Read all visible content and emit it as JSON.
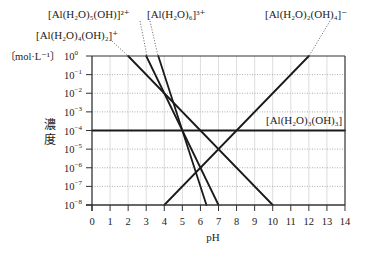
{
  "chart_data": {
    "type": "line",
    "title": "",
    "xlabel": "pH",
    "ylabel": "濃度",
    "yunit": "〔mol·L⁻¹〕",
    "xlim": [
      0,
      14
    ],
    "ylim_log10": [
      -8,
      0
    ],
    "x_ticks": [
      "0",
      "1",
      "2",
      "3",
      "4",
      "5",
      "6",
      "7",
      "8",
      "9",
      "10",
      "11",
      "12",
      "13",
      "14"
    ],
    "y_ticks": [
      {
        "exp": 0,
        "label": "10",
        "sup": "0"
      },
      {
        "exp": -1,
        "label": "10",
        "sup": "−1"
      },
      {
        "exp": -2,
        "label": "10",
        "sup": "−2"
      },
      {
        "exp": -3,
        "label": "10",
        "sup": "−3"
      },
      {
        "exp": -4,
        "label": "10",
        "sup": "−4"
      },
      {
        "exp": -5,
        "label": "10",
        "sup": "−5"
      },
      {
        "exp": -6,
        "label": "10",
        "sup": "−6"
      },
      {
        "exp": -7,
        "label": "10",
        "sup": "−7"
      },
      {
        "exp": -8,
        "label": "10",
        "sup": "−8"
      }
    ],
    "grid": true,
    "series": [
      {
        "name": "[Al(H2O)6]3+",
        "label": "[Al(H₂O)₆]³⁺",
        "points": [
          [
            3.667,
            0
          ],
          [
            6.333,
            -8
          ]
        ],
        "slope": -3
      },
      {
        "name": "[Al(H2O)5(OH)]2+",
        "label": "[Al(H₂O)₅(OH)]²⁺",
        "points": [
          [
            3,
            0
          ],
          [
            7,
            -8
          ]
        ],
        "slope": -2
      },
      {
        "name": "[Al(H2O)4(OH)2]+",
        "label": "[Al(H₂O)₄(OH)₂]⁺",
        "points": [
          [
            2,
            0
          ],
          [
            10,
            -8
          ]
        ],
        "slope": -1
      },
      {
        "name": "[Al(H2O)3(OH)3]",
        "label": "[Al(H₂O)₃(OH)₃]",
        "points": [
          [
            0,
            -4
          ],
          [
            14,
            -4
          ]
        ],
        "slope": 0
      },
      {
        "name": "[Al(H2O)2(OH)4]-",
        "label": "[Al(H₂O)₂(OH)₄]⁻",
        "points": [
          [
            4,
            -8
          ],
          [
            12,
            0
          ]
        ],
        "slope": 1
      }
    ],
    "labels": {
      "hex_aqua": "[Al(H₂O)₆]³⁺",
      "penta_hydroxo": "[Al(H₂O)₅(OH)]²⁺",
      "tetra_dihydroxo": "[Al(H₂O)₄(OH)₂]⁺",
      "tri_trihydroxo": "[Al(H₂O)₃(OH)₃]",
      "di_tetrahydroxo": "[Al(H₂O)₂(OH)₄]⁻"
    },
    "ylabel_chars": [
      "濃",
      "度"
    ]
  }
}
